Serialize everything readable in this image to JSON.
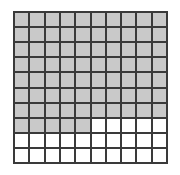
{
  "figure": {
    "kind": "hundredths-grid",
    "rows": 10,
    "columns": 10,
    "total_cells": 100,
    "shaded_cells": 75,
    "unshaded_cells": 25,
    "fraction": "75/100",
    "decimal": "0.75",
    "percent": "75%",
    "colors": {
      "shaded": "#c9c9c9",
      "unshaded": "#ffffff",
      "gridline": "#3a3a3a",
      "background": "#ffffff"
    }
  },
  "chart_data": {
    "type": "heatmap",
    "title": "",
    "xlabel": "",
    "ylabel": "",
    "grid": true,
    "legend": "none",
    "categories": [
      "c1",
      "c2",
      "c3",
      "c4",
      "c5",
      "c6",
      "c7",
      "c8",
      "c9",
      "c10"
    ],
    "row_labels": [
      "r1",
      "r2",
      "r3",
      "r4",
      "r5",
      "r6",
      "r7",
      "r8",
      "r9",
      "r10"
    ],
    "row_shaded_counts": [
      10,
      10,
      10,
      10,
      10,
      10,
      10,
      5,
      0,
      0
    ],
    "values": [
      [
        1,
        1,
        1,
        1,
        1,
        1,
        1,
        1,
        1,
        1
      ],
      [
        1,
        1,
        1,
        1,
        1,
        1,
        1,
        1,
        1,
        1
      ],
      [
        1,
        1,
        1,
        1,
        1,
        1,
        1,
        1,
        1,
        1
      ],
      [
        1,
        1,
        1,
        1,
        1,
        1,
        1,
        1,
        1,
        1
      ],
      [
        1,
        1,
        1,
        1,
        1,
        1,
        1,
        1,
        1,
        1
      ],
      [
        1,
        1,
        1,
        1,
        1,
        1,
        1,
        1,
        1,
        1
      ],
      [
        1,
        1,
        1,
        1,
        1,
        1,
        1,
        1,
        1,
        1
      ],
      [
        1,
        1,
        1,
        1,
        1,
        0,
        0,
        0,
        0,
        0
      ],
      [
        0,
        0,
        0,
        0,
        0,
        0,
        0,
        0,
        0,
        0
      ],
      [
        0,
        0,
        0,
        0,
        0,
        0,
        0,
        0,
        0,
        0
      ]
    ]
  }
}
